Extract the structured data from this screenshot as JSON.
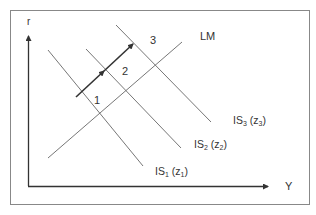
{
  "diagram": {
    "type": "IS-LM",
    "axes": {
      "x_label": "Y",
      "y_label": "r"
    },
    "curves": [
      {
        "id": "LM",
        "label": "LM"
      },
      {
        "id": "IS1",
        "label_main": "IS",
        "label_sub": "1",
        "param_main": "z",
        "param_sub": "1"
      },
      {
        "id": "IS2",
        "label_main": "IS",
        "label_sub": "2",
        "param_main": "z",
        "param_sub": "2"
      },
      {
        "id": "IS3",
        "label_main": "IS",
        "label_sub": "3",
        "param_main": "z",
        "param_sub": "3"
      }
    ],
    "equilibria": [
      {
        "label": "1"
      },
      {
        "label": "2"
      },
      {
        "label": "3"
      }
    ],
    "colors": {
      "line": "#555555",
      "arrow": "#333333",
      "frame": "#777777",
      "text": "#333333"
    }
  }
}
